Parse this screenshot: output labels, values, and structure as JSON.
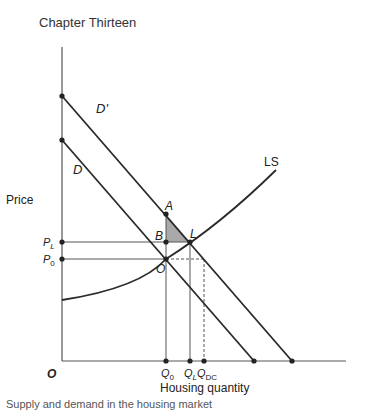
{
  "header": {
    "chapter_title": "Chapter Thirteen"
  },
  "diagram": {
    "y_axis_label": "Price",
    "x_axis_label": "Housing quantity",
    "origin_label": "O",
    "curves": [
      {
        "id": "D_prime",
        "label": "D'",
        "type": "demand (shifted)"
      },
      {
        "id": "D",
        "label": "D",
        "type": "demand"
      },
      {
        "id": "LS",
        "label": "LS",
        "type": "long-run supply"
      }
    ],
    "points": [
      {
        "label": "A"
      },
      {
        "label": "B"
      },
      {
        "label": "L"
      },
      {
        "label": "O"
      }
    ],
    "price_ticks": [
      {
        "base": "P",
        "sub": "L"
      },
      {
        "base": "P",
        "sub": "0"
      }
    ],
    "quantity_ticks": [
      {
        "base": "Q",
        "sub": "0"
      },
      {
        "base": "Q",
        "sub": "L"
      },
      {
        "base": "Q",
        "sub": "DC"
      }
    ],
    "shaded_region": "triangle A-B-L",
    "colors": {
      "line": "#2a2a2a",
      "shade": "#a9a9a9",
      "dashed": "#555555"
    }
  },
  "footer": {
    "cut_text": "Supply and demand in the housing market"
  }
}
